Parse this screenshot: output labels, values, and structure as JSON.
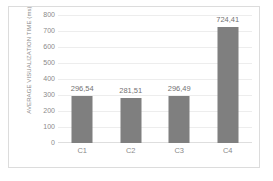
{
  "chart_data": {
    "type": "bar",
    "title": "",
    "xlabel": "",
    "ylabel": "AVERAGE VISUALIZATION TIME (ms)",
    "categories": [
      "C1",
      "C2",
      "C3",
      "C4"
    ],
    "values": [
      296.54,
      281.51,
      296.49,
      724.41
    ],
    "data_labels": [
      "296,54",
      "281,51",
      "296,49",
      "724,41"
    ],
    "ylim": [
      0,
      800
    ],
    "yticks": [
      0,
      100,
      200,
      300,
      400,
      500,
      600,
      700,
      800
    ],
    "ytick_labels": [
      "0",
      "100",
      "200",
      "300",
      "400",
      "500",
      "600",
      "700",
      "800"
    ],
    "grid": true,
    "legend": false,
    "bar_color": "#7f7f7f",
    "grid_color": "#ededed",
    "text_color": "#8a8a8a",
    "frame_color": "#dcdcdc",
    "background": "#ffffff"
  }
}
